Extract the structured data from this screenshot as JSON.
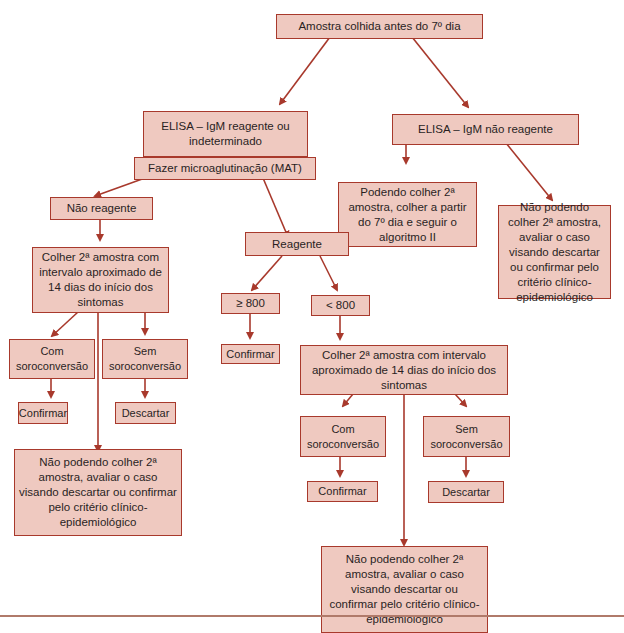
{
  "diagram": {
    "colors": {
      "box_fill": "#efc9c0",
      "box_border": "#a8392c",
      "arrow": "#a8392c"
    },
    "nodes": {
      "start": "Amostra colhida antes do 7º dia",
      "elisa_reagente": "ELISA – IgM reagente ou indeterminado",
      "elisa_nao_reagente": "ELISA – IgM não reagente",
      "mat": "Fazer microaglutinação (MAT)",
      "podendo_colher": "Podendo colher 2ª amostra, colher a partir do 7º dia e seguir o algoritmo II",
      "nao_podendo_right": "Não podendo colher 2ª amostra, avaliar o caso visando descartar ou confirmar pelo critério clínico-epidemiológico",
      "nao_reagente": "Não reagente",
      "reagente": "Reagente",
      "colher_left": "Colher 2ª amostra com intervalo aproximado de 14 dias do início dos sintomas",
      "ge800": "≥ 800",
      "lt800": "< 800",
      "com_soro_left": "Com soroconversão",
      "sem_soro_left": "Sem soroconversão",
      "confirmar_ge800": "Confirmar",
      "colher_right": "Colher 2ª amostra com intervalo aproximado de 14 dias do início dos sintomas",
      "confirmar_left": "Confirmar",
      "descartar_left": "Descartar",
      "nao_podendo_left": "Não podendo colher 2ª amostra, avaliar o caso visando descartar ou confirmar pelo critério clínico-epidemiológico",
      "com_soro_right": "Com soroconversão",
      "sem_soro_right": "Sem soroconversão",
      "confirmar_right": "Confirmar",
      "descartar_right": "Descartar",
      "nao_podendo_bottom": "Não podendo colher 2ª amostra, avaliar o caso visando descartar ou confirmar pelo critério clínico-epidemiológico"
    }
  }
}
